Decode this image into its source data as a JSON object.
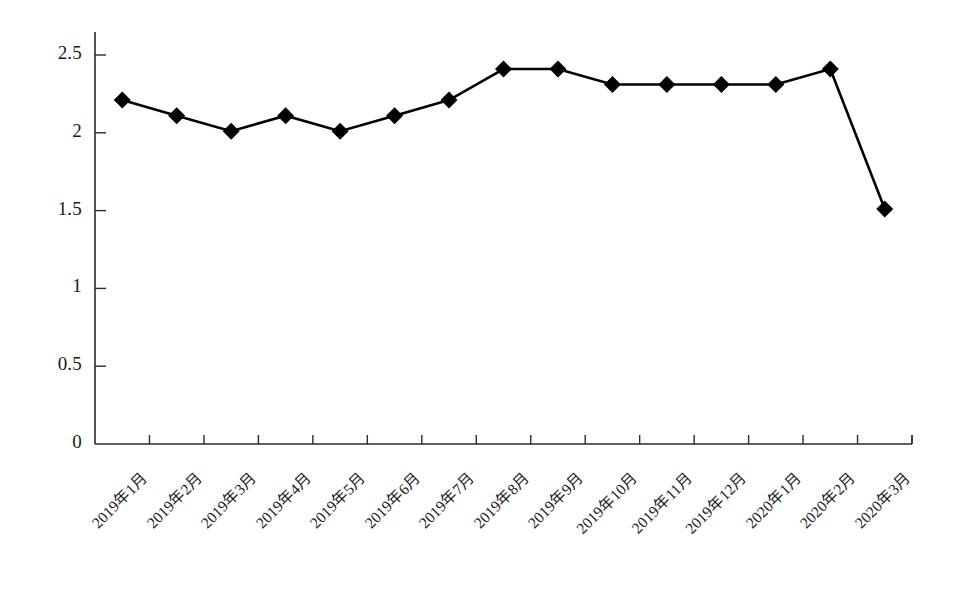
{
  "chart_data": {
    "type": "line",
    "title": "",
    "subtitle": "",
    "xlabel": "",
    "ylabel": "",
    "ylim": [
      0,
      2.5
    ],
    "ytick_labels": [
      "0",
      "0.5",
      "1",
      "1.5",
      "2",
      "2.5"
    ],
    "ytick_values": [
      0,
      0.5,
      1,
      1.5,
      2,
      2.5
    ],
    "grid": false,
    "legend": null,
    "legend_position": "none",
    "marker": "diamond",
    "series_color": "#000000",
    "categories": [
      "2019年1月",
      "2019年2月",
      "2019年3月",
      "2019年4月",
      "2019年5月",
      "2019年6月",
      "2019年7月",
      "2019年8月",
      "2019年9月",
      "2019年10月",
      "2019年11月",
      "2019年12月",
      "2020年1月",
      "2020年2月",
      "2020年3月"
    ],
    "values": [
      2.21,
      2.11,
      2.01,
      2.11,
      2.01,
      2.11,
      2.21,
      2.41,
      2.41,
      2.31,
      2.31,
      2.31,
      2.31,
      2.41,
      1.51
    ]
  }
}
